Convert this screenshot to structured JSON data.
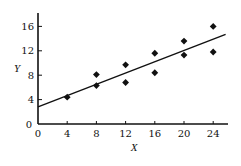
{
  "chart_data": {
    "type": "scatter",
    "title": "",
    "xlabel": "X",
    "ylabel": "Y",
    "xlim": [
      0,
      26
    ],
    "ylim": [
      0,
      18
    ],
    "x_ticks": [
      0,
      4,
      8,
      12,
      16,
      20,
      24
    ],
    "y_ticks": [
      0,
      4,
      8,
      12,
      16
    ],
    "grid": false,
    "legend": null,
    "series": [
      {
        "name": "observations",
        "marker": "diamond",
        "points": [
          {
            "x": 4,
            "y": 4.4
          },
          {
            "x": 8,
            "y": 8.1
          },
          {
            "x": 8,
            "y": 6.3
          },
          {
            "x": 12,
            "y": 9.7
          },
          {
            "x": 12,
            "y": 6.8
          },
          {
            "x": 16,
            "y": 11.6
          },
          {
            "x": 16,
            "y": 8.4
          },
          {
            "x": 20,
            "y": 13.6
          },
          {
            "x": 20,
            "y": 11.3
          },
          {
            "x": 24,
            "y": 16.0
          },
          {
            "x": 24,
            "y": 11.8
          }
        ]
      }
    ],
    "fit_line": {
      "name": "regression line",
      "x0": 0,
      "y0": 2.8,
      "x1": 25.7,
      "y1": 14.7
    }
  },
  "colors": {
    "ink": "#111111",
    "background": "#ffffff"
  }
}
